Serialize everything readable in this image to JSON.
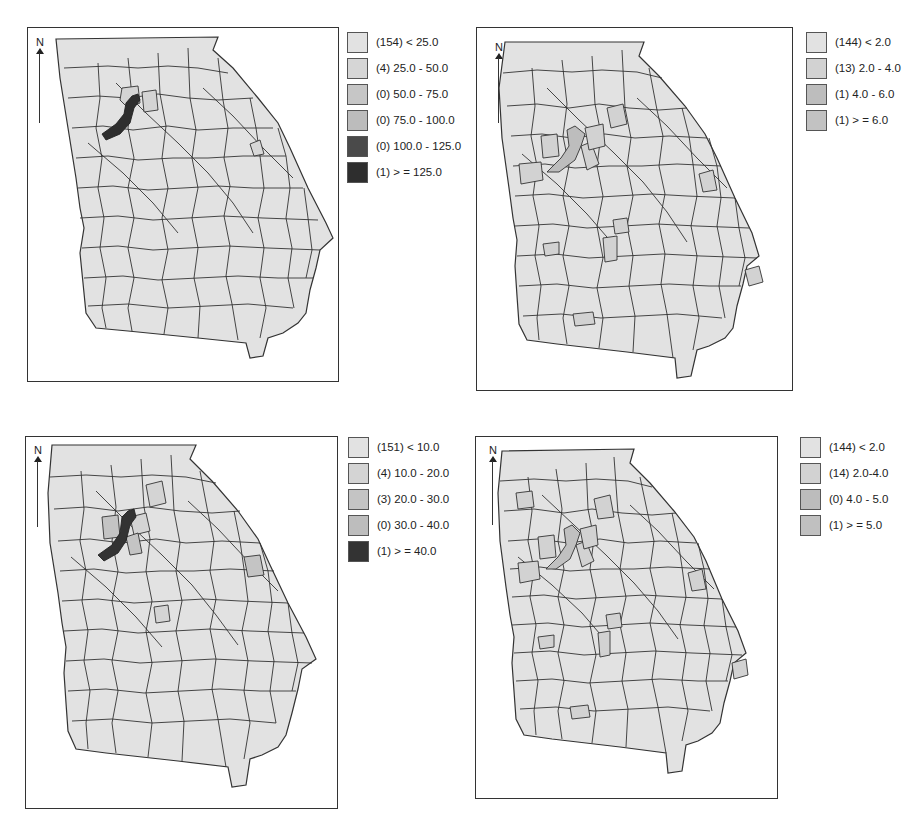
{
  "figure": {
    "panels": [
      {
        "id": "top-left",
        "north_label": "N",
        "legend": [
          {
            "count": 154,
            "range": "< 25.0",
            "label": "(154) < 25.0",
            "color": "#e2e2e2"
          },
          {
            "count": 4,
            "range": "25.0 - 50.0",
            "label": "(4) 25.0 - 50.0",
            "color": "#d6d6d6"
          },
          {
            "count": 0,
            "range": "50.0 - 75.0",
            "label": "(0) 50.0 - 75.0",
            "color": "#c6c6c6"
          },
          {
            "count": 0,
            "range": "75.0 - 100.0",
            "label": "(0) 75.0 - 100.0",
            "color": "#bcbcbc"
          },
          {
            "count": 0,
            "range": "100.0 - 125.0",
            "label": "(0) 100.0 - 125.0",
            "color": "#4a4a4a"
          },
          {
            "count": 1,
            "range": ">= 125.0",
            "label": "(1) > = 125.0",
            "color": "#2e2e2e"
          }
        ]
      },
      {
        "id": "top-right",
        "north_label": "N",
        "legend": [
          {
            "count": 144,
            "range": "< 2.0",
            "label": "(144) < 2.0",
            "color": "#e2e2e2"
          },
          {
            "count": 13,
            "range": "2.0 - 4.0",
            "label": "(13) 2.0 - 4.0",
            "color": "#d2d2d2"
          },
          {
            "count": 1,
            "range": "4.0 - 6.0",
            "label": "(1) 4.0 - 6.0",
            "color": "#bdbdbd"
          },
          {
            "count": 1,
            "range": ">= 6.0",
            "label": "(1) > = 6.0",
            "color": "#c2c2c2"
          }
        ]
      },
      {
        "id": "bottom-left",
        "north_label": "N",
        "legend": [
          {
            "count": 151,
            "range": "< 10.0",
            "label": "(151) < 10.0",
            "color": "#e2e2e2"
          },
          {
            "count": 4,
            "range": "10.0 - 20.0",
            "label": "(4) 10.0 - 20.0",
            "color": "#d4d4d4"
          },
          {
            "count": 3,
            "range": "20.0 - 30.0",
            "label": "(3) 20.0 - 30.0",
            "color": "#c4c4c4"
          },
          {
            "count": 0,
            "range": "30.0 - 40.0",
            "label": "(0) 30.0 - 40.0",
            "color": "#bdbdbd"
          },
          {
            "count": 1,
            "range": ">= 40.0",
            "label": "(1) > = 40.0",
            "color": "#333333"
          }
        ]
      },
      {
        "id": "bottom-right",
        "north_label": "N",
        "legend": [
          {
            "count": 144,
            "range": "< 2.0",
            "label": "(144) < 2.0",
            "color": "#e2e2e2"
          },
          {
            "count": 14,
            "range": "2.0-4.0",
            "label": "(14) 2.0-4.0",
            "color": "#d2d2d2"
          },
          {
            "count": 0,
            "range": "4.0 - 5.0",
            "label": "(0) 4.0 - 5.0",
            "color": "#bcbcbc"
          },
          {
            "count": 1,
            "range": ">= 5.0",
            "label": "(1) > = 5.0",
            "color": "#c0c0c0"
          }
        ]
      }
    ],
    "colors": {
      "county_base": "#e2e2e2",
      "county_border": "#333333",
      "panel_border": "#333333"
    }
  }
}
